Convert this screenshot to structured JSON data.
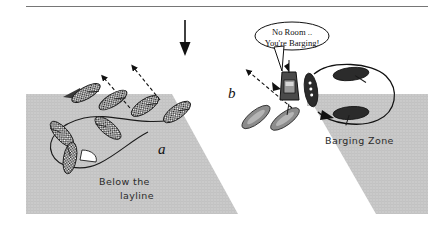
{
  "figure": {
    "panels": [
      {
        "id": "a",
        "label": "a",
        "caption": "Below the layline"
      },
      {
        "id": "b",
        "label": "b",
        "caption": "Barging Zone"
      }
    ],
    "wind_arrow": {
      "name": "wind-direction-arrow",
      "direction": "down"
    },
    "top_rule": true
  },
  "labels": {
    "panel_a": "a",
    "panel_b": "b",
    "below_layline_line1": "Below the",
    "below_layline_line2": "layline",
    "barging_zone": "Barging Zone"
  },
  "speech_bubble": {
    "line1": "No Room ..",
    "line2": "You're Barging!"
  },
  "colors": {
    "background": "#ffffff",
    "zone_fill": "#c9c9c9",
    "zone_fill_light": "#d6d6d6",
    "ink": "#111111",
    "boat_dark": "#2a2a2a",
    "boat_gray": "#8f8f8f",
    "rule_line": "#555555"
  },
  "boats": {
    "panel_a_checkered": [
      {
        "name": "boat-a-1",
        "x": 178,
        "y": 112,
        "rot": -38
      },
      {
        "name": "boat-a-2",
        "x": 143,
        "y": 105,
        "rot": -35
      },
      {
        "name": "boat-a-3",
        "x": 112,
        "y": 100,
        "rot": -33
      },
      {
        "name": "boat-a-4",
        "x": 85,
        "y": 93,
        "rot": -30
      },
      {
        "name": "boat-a-5",
        "x": 108,
        "y": 126,
        "rot": 42
      },
      {
        "name": "boat-a-6",
        "x": 62,
        "y": 133,
        "rot": 52
      },
      {
        "name": "boat-a-7",
        "x": 66,
        "y": 158,
        "rot": 100
      }
    ],
    "panel_b_dark": [
      {
        "name": "boat-b-top",
        "x": 351,
        "y": 74,
        "rot": 82
      },
      {
        "name": "boat-b-left",
        "x": 311,
        "y": 90,
        "rot": 8
      },
      {
        "name": "boat-b-bottom",
        "x": 351,
        "y": 113,
        "rot": 80
      }
    ],
    "panel_b_gray": [
      {
        "name": "boat-b-gray-1",
        "x": 256,
        "y": 116,
        "rot": -40
      },
      {
        "name": "boat-b-gray-2",
        "x": 283,
        "y": 118,
        "rot": -38
      }
    ],
    "committee_boat": {
      "name": "committee-boat",
      "x": 289,
      "y": 83
    }
  }
}
